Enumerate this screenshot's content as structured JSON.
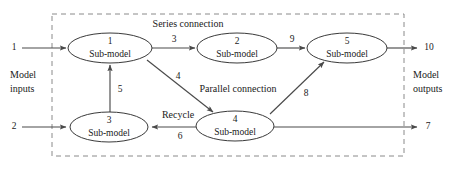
{
  "figure": {
    "type": "process-flow-diagram",
    "background_color": "#ffffff",
    "line_color": "#4a4a4a",
    "box_color": "#8a8a8a",
    "text_color": "#1a1a1a",
    "width": 456,
    "height": 171
  },
  "group_box": {
    "style": "dashed",
    "x": 52,
    "y": 14,
    "width": 352,
    "height": 142
  },
  "group_labels": [
    {
      "name": "series-connection",
      "text": "Series connection",
      "x": 188,
      "y": 25
    },
    {
      "name": "parallel-connection",
      "text": "Parallel connection",
      "x": 238,
      "y": 90
    }
  ],
  "nodes": [
    {
      "id": "sub-model-1",
      "index": "1",
      "label": "Sub-model",
      "cx": 110,
      "cy": 48,
      "rx": 42,
      "ry": 15
    },
    {
      "id": "sub-model-2",
      "index": "2",
      "label": "Sub-model",
      "cx": 237,
      "cy": 48,
      "rx": 40,
      "ry": 15
    },
    {
      "id": "sub-model-5",
      "index": "5",
      "label": "Sub-model",
      "cx": 347,
      "cy": 48,
      "rx": 40,
      "ry": 15
    },
    {
      "id": "sub-model-3",
      "index": "3",
      "label": "Sub-model",
      "cx": 109,
      "cy": 127,
      "rx": 39,
      "ry": 15
    },
    {
      "id": "sub-model-4",
      "index": "4",
      "label": "Sub-model",
      "cx": 235,
      "cy": 126,
      "rx": 39,
      "ry": 15
    }
  ],
  "streams": [
    {
      "id": "stream-1",
      "label": "1",
      "label_x": 14,
      "label_y": 48,
      "from": "model-inputs",
      "to": "sub-model-1"
    },
    {
      "id": "stream-3",
      "label": "3",
      "label_x": 174,
      "label_y": 40,
      "from": "sub-model-1",
      "to": "sub-model-2"
    },
    {
      "id": "stream-9",
      "label": "9",
      "label_x": 292,
      "label_y": 40,
      "from": "sub-model-2",
      "to": "sub-model-5"
    },
    {
      "id": "stream-10",
      "label": "10",
      "label_x": 427,
      "label_y": 48,
      "from": "sub-model-5",
      "to": "model-outputs"
    },
    {
      "id": "stream-4",
      "label": "4",
      "label_x": 178,
      "label_y": 77,
      "from": "sub-model-1",
      "to": "sub-model-4"
    },
    {
      "id": "stream-5",
      "label": "5",
      "label_x": 119,
      "label_y": 90,
      "from": "sub-model-3",
      "to": "sub-model-1"
    },
    {
      "id": "stream-8",
      "label": "8",
      "label_x": 305,
      "label_y": 94,
      "from": "sub-model-4",
      "to": "sub-model-5"
    },
    {
      "id": "stream-6",
      "label": "6",
      "label_x": 180,
      "label_y": 136,
      "from": "sub-model-4",
      "to": "sub-model-3"
    },
    {
      "id": "stream-2",
      "label": "2",
      "label_x": 14,
      "label_y": 127,
      "from": "model-inputs",
      "to": "sub-model-3"
    },
    {
      "id": "stream-7",
      "label": "7",
      "label_x": 427,
      "label_y": 127,
      "from": "sub-model-4",
      "to": "model-outputs"
    }
  ],
  "edge_annotations": [
    {
      "name": "recycle-label",
      "text": "Recycle",
      "x": 178,
      "y": 116
    }
  ],
  "io_captions": [
    {
      "name": "model-inputs-caption",
      "line1": "Model",
      "line2": "inputs",
      "x": 10,
      "y": 76
    },
    {
      "name": "model-outputs-caption",
      "line1": "Model",
      "line2": "outputs",
      "x": 413,
      "y": 76
    }
  ]
}
